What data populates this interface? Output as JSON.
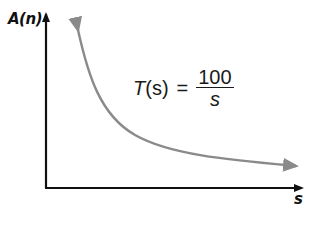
{
  "diagram": {
    "y_axis_label": "A(n)",
    "x_axis_label": "s",
    "curve_label": {
      "lhs_func": "T",
      "lhs_arg": "(s)",
      "equals": "=",
      "numerator": "100",
      "denominator": "s"
    },
    "colors": {
      "axis": "#111111",
      "curve": "#8a8a8a",
      "background": "#ffffff"
    }
  }
}
